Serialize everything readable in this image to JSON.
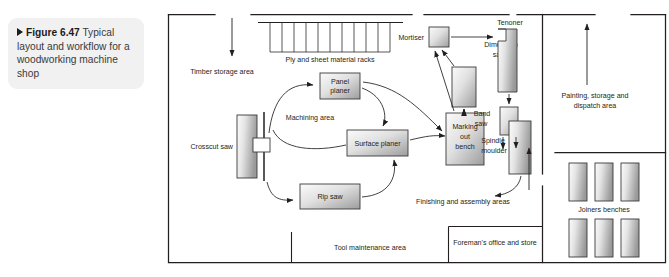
{
  "caption": {
    "marker": "triangle-right",
    "figure_number": "Figure 6.47",
    "text": "Typical layout and workflow for a woodworking machine shop",
    "full": "Figure 6.47 Typical layout and workflow for a woodworking machine shop"
  },
  "diagram": {
    "title": "Typical layout and workflow for a woodworking machine shop",
    "type": "factory-floor-plan",
    "areas": [
      {
        "id": "timber-storage",
        "label": "Timber storage area"
      },
      {
        "id": "ply-racks",
        "label": "Ply and sheet material racks",
        "bays": 11
      },
      {
        "id": "machining",
        "label": "Machining area"
      },
      {
        "id": "painting",
        "label": "Painting, storage and dispatch area"
      },
      {
        "id": "finishing",
        "label": "Finishing and assembly areas"
      },
      {
        "id": "tool-maintenance",
        "label": "Tool maintenance area"
      },
      {
        "id": "foremans-office",
        "label": "Foreman's office and store"
      },
      {
        "id": "joiners-benches",
        "label": "Joiners benches",
        "count": 6
      }
    ],
    "machines": [
      {
        "id": "crosscut-saw",
        "label": "Crosscut saw"
      },
      {
        "id": "panel-planer",
        "label": "Panel planer",
        "lines": [
          "Panel",
          "planer"
        ]
      },
      {
        "id": "surface-planer",
        "label": "Surface planer"
      },
      {
        "id": "rip-saw",
        "label": "Rip saw"
      },
      {
        "id": "marking-out-bench",
        "label": "Marking out bench",
        "lines": [
          "Marking",
          "out",
          "bench"
        ]
      },
      {
        "id": "mortiser",
        "label": "Mortiser"
      },
      {
        "id": "dimension-saw",
        "label": "Dimension saw",
        "lines": [
          "Dimension",
          "saw"
        ]
      },
      {
        "id": "tenoner",
        "label": "Tenoner"
      },
      {
        "id": "band-saw",
        "label": "Band saw",
        "lines": [
          "Band",
          "saw"
        ]
      },
      {
        "id": "spindle-moulder",
        "label": "Spindle moulder",
        "lines": [
          "Spindle",
          "moulder"
        ]
      }
    ],
    "colors": {
      "wall": "#231f20",
      "machine_fill_light": "#f4f4f4",
      "machine_fill_dark": "#9a9a9a",
      "machine_stroke": "#3a3a3a",
      "arrow": "#231f20",
      "caption_bg": "#f1f1f1",
      "text": "#231f20"
    }
  }
}
